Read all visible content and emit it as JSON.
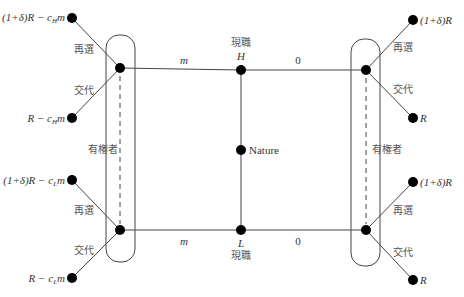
{
  "diagram": {
    "type": "game-tree",
    "center": {
      "nature_label": "Nature",
      "high_label": "H",
      "low_label": "L",
      "high_caption": "現職",
      "low_caption": "現職"
    },
    "edges": {
      "left_top_label": "m",
      "right_top_label": "0",
      "left_bottom_label": "m",
      "right_bottom_label": "0"
    },
    "info_sets": {
      "left_label": "有権者",
      "right_label": "有権者"
    },
    "actions": {
      "reelect": "再選",
      "replace": "交代"
    },
    "payoffs": {
      "left_top_reelect_prefix": "(1+δ)R − c",
      "left_top_reelect_sub": "H",
      "left_top_reelect_suffix": "m",
      "left_top_replace_prefix": "R − c",
      "left_top_replace_sub": "H",
      "left_top_replace_suffix": "m",
      "left_bottom_reelect_prefix": "(1+δ)R − c",
      "left_bottom_reelect_sub": "L",
      "left_bottom_reelect_suffix": "m",
      "left_bottom_replace_prefix": "R − c",
      "left_bottom_replace_sub": "L",
      "left_bottom_replace_suffix": "m",
      "right_top_reelect": "(1+δ)R",
      "right_top_replace": "R",
      "right_bottom_reelect": "(1+δ)R",
      "right_bottom_replace": "R"
    }
  }
}
